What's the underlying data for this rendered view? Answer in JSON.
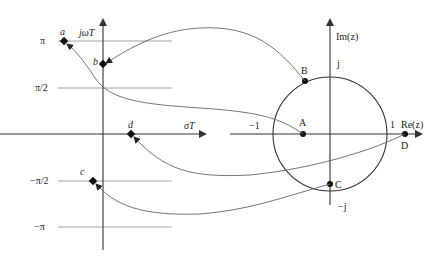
{
  "s_plane": {
    "vertical_axis_label": "jωT",
    "horizontal_axis_label": "σT",
    "tick_labels": {
      "pi": "π",
      "half_pi": "π/2",
      "neg_half_pi": "−π/2",
      "neg_pi": "−π"
    },
    "points": {
      "a": "a",
      "b": "b",
      "c": "c",
      "d": "d"
    }
  },
  "z_plane": {
    "vertical_axis_label": "Im(z)",
    "horizontal_axis_label": "Re(z)",
    "tick_labels": {
      "j": "j",
      "neg_j": "−j",
      "neg_one": "−1",
      "one": "1"
    },
    "points": {
      "A": "A",
      "B": "B",
      "C": "C",
      "D": "D"
    }
  },
  "mappings": [
    {
      "from": "A",
      "to": "a"
    },
    {
      "from": "B",
      "to": "b"
    },
    {
      "from": "C",
      "to": "c"
    },
    {
      "from": "D",
      "to": "d"
    }
  ],
  "colors": {
    "axis": "#333333",
    "gridline": "#999999",
    "curve": "#666666",
    "point": "#111111"
  }
}
